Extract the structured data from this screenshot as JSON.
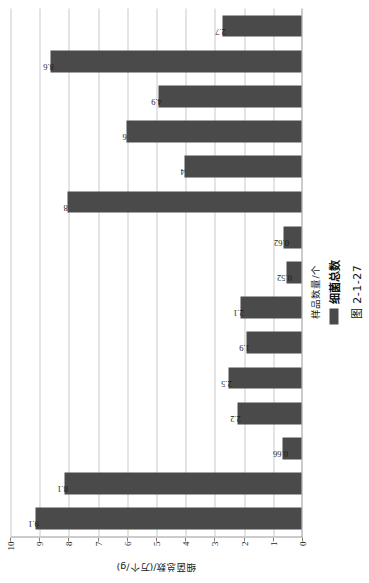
{
  "figure": {
    "caption": "图 2-1-27",
    "legend_label": "细菌总数"
  },
  "chart_data": {
    "type": "bar",
    "title": "",
    "xlabel": "样品数量/个",
    "ylabel": "细菌总数/(万个/g)",
    "orientation": "vertical-bars-drawn-rotated-90ccw",
    "ylim": [
      0,
      10
    ],
    "yticks": [
      "0",
      "1",
      "2",
      "3",
      "4",
      "5",
      "6",
      "7",
      "8",
      "9",
      "10"
    ],
    "grid": true,
    "legend_position": "bottom-center",
    "bar_color": "#4a4a4a",
    "categories": [
      "1",
      "2",
      "3",
      "4",
      "5",
      "6",
      "7",
      "8",
      "9",
      "10",
      "11",
      "12",
      "13",
      "14",
      "15"
    ],
    "values": [
      9.1,
      8.1,
      0.66,
      2.2,
      2.5,
      1.9,
      2.1,
      0.52,
      0.62,
      8,
      4,
      6,
      4.9,
      8.6,
      2.7
    ],
    "data_labels": [
      "9.1",
      "8.1",
      "0.66",
      "2.2",
      "2.5",
      "1.9",
      "2.1",
      "0.52",
      "0.62",
      "8",
      "4",
      "6",
      "4.9",
      "8.6",
      "2.7"
    ],
    "series": [
      {
        "name": "细菌总数",
        "values": [
          9.1,
          8.1,
          0.66,
          2.2,
          2.5,
          1.9,
          2.1,
          0.52,
          0.62,
          8,
          4,
          6,
          4.9,
          8.6,
          2.7
        ]
      }
    ]
  }
}
